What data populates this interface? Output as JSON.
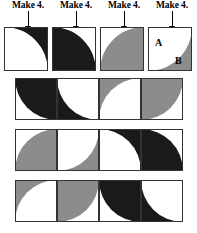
{
  "figure": {
    "colors": {
      "black": "#1a1a1a",
      "gray": "#8c8c8c",
      "white": "#ffffff",
      "outline": "#333333"
    }
  },
  "prototypes": {
    "instruction_label": "Make 4.",
    "arrow_icon": "down-arrow-icon",
    "tiles": [
      {
        "name": "tile-1",
        "background": "#1a1a1a",
        "arc_color": "#ffffff",
        "arc_corner": "bl"
      },
      {
        "name": "tile-2",
        "background": "#ffffff",
        "arc_color": "#1a1a1a",
        "arc_corner": "bl"
      },
      {
        "name": "tile-3",
        "background": "#ffffff",
        "arc_color": "#8c8c8c",
        "arc_corner": "br"
      },
      {
        "name": "tile-4",
        "background": "#8c8c8c",
        "arc_color": "#ffffff",
        "arc_corner": "tl"
      }
    ],
    "region_labels": {
      "a": "A",
      "b": "B"
    }
  },
  "strips": [
    {
      "name": "strip-1",
      "cells": [
        {
          "background": "#ffffff",
          "arc_color": "#1a1a1a",
          "arc_corner": "tr"
        },
        {
          "background": "#1a1a1a",
          "arc_color": "#ffffff",
          "arc_corner": "tr"
        },
        {
          "background": "#8c8c8c",
          "arc_color": "#ffffff",
          "arc_corner": "br"
        },
        {
          "background": "#ffffff",
          "arc_color": "#8c8c8c",
          "arc_corner": "tl"
        }
      ]
    },
    {
      "name": "strip-2",
      "cells": [
        {
          "background": "#ffffff",
          "arc_color": "#8c8c8c",
          "arc_corner": "br"
        },
        {
          "background": "#8c8c8c",
          "arc_color": "#ffffff",
          "arc_corner": "tl"
        },
        {
          "background": "#1a1a1a",
          "arc_color": "#ffffff",
          "arc_corner": "bl"
        },
        {
          "background": "#ffffff",
          "arc_color": "#1a1a1a",
          "arc_corner": "bl"
        }
      ]
    },
    {
      "name": "strip-3",
      "cells": [
        {
          "background": "#8c8c8c",
          "arc_color": "#ffffff",
          "arc_corner": "br"
        },
        {
          "background": "#ffffff",
          "arc_color": "#8c8c8c",
          "arc_corner": "tl"
        },
        {
          "background": "#ffffff",
          "arc_color": "#1a1a1a",
          "arc_corner": "tr"
        },
        {
          "background": "#1a1a1a",
          "arc_color": "#ffffff",
          "arc_corner": "tr"
        }
      ]
    }
  ]
}
